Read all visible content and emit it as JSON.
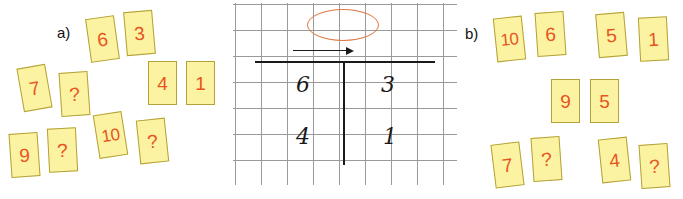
{
  "figure": {
    "panels": [
      {
        "label": "a)",
        "label_pos": {
          "x": 57,
          "y": 24
        },
        "cards": [
          {
            "value": "6",
            "x": 88,
            "y": 17,
            "rot": -8,
            "wide": false
          },
          {
            "value": "3",
            "x": 125,
            "y": 11,
            "rot": -5,
            "wide": false
          },
          {
            "value": "7",
            "x": 20,
            "y": 66,
            "rot": -10,
            "wide": false
          },
          {
            "value": "?",
            "x": 60,
            "y": 72,
            "rot": -4,
            "wide": false
          },
          {
            "value": "4",
            "x": 148,
            "y": 61,
            "rot": 0,
            "wide": false
          },
          {
            "value": "1",
            "x": 186,
            "y": 61,
            "rot": 0,
            "wide": false
          },
          {
            "value": "10",
            "x": 96,
            "y": 113,
            "rot": -9,
            "wide": true
          },
          {
            "value": "?",
            "x": 138,
            "y": 119,
            "rot": -6,
            "wide": false
          },
          {
            "value": "9",
            "x": 10,
            "y": 133,
            "rot": -4,
            "wide": false
          },
          {
            "value": "?",
            "x": 48,
            "y": 128,
            "rot": -3,
            "wide": false
          }
        ]
      },
      {
        "label": "b)",
        "label_pos": {
          "x": 465,
          "y": 25
        },
        "cards": [
          {
            "value": "10",
            "x": 495,
            "y": 17,
            "rot": -6,
            "wide": true
          },
          {
            "value": "6",
            "x": 536,
            "y": 12,
            "rot": -4,
            "wide": false
          },
          {
            "value": "5",
            "x": 597,
            "y": 13,
            "rot": -5,
            "wide": false
          },
          {
            "value": "1",
            "x": 639,
            "y": 17,
            "rot": -3,
            "wide": false
          },
          {
            "value": "9",
            "x": 551,
            "y": 79,
            "rot": 0,
            "wide": false
          },
          {
            "value": "5",
            "x": 590,
            "y": 79,
            "rot": 0,
            "wide": false
          },
          {
            "value": "7",
            "x": 493,
            "y": 143,
            "rot": -7,
            "wide": false
          },
          {
            "value": "?",
            "x": 532,
            "y": 137,
            "rot": -4,
            "wide": false
          },
          {
            "value": "4",
            "x": 600,
            "y": 138,
            "rot": -6,
            "wide": false
          },
          {
            "value": "?",
            "x": 640,
            "y": 144,
            "rot": -4,
            "wide": false
          }
        ]
      }
    ],
    "grid": {
      "cell_size": 26,
      "line_color": "#9a9a9a",
      "ellipse": {
        "x": 74,
        "y": 6,
        "width": 70,
        "height": 30,
        "color": "#e07a46"
      },
      "arrow": {
        "x": 60,
        "y": 47,
        "length": 55,
        "direction": "right",
        "color": "#1a1a1a"
      },
      "t_shape": {
        "horizontal": {
          "x": 22,
          "y": 58,
          "width": 180
        },
        "vertical": {
          "x": 110,
          "y": 58,
          "height": 104
        },
        "color": "#1a1a1a"
      },
      "digits": [
        {
          "value": "6",
          "x": 63,
          "y": 71
        },
        {
          "value": "3",
          "x": 148,
          "y": 71
        },
        {
          "value": "4",
          "x": 63,
          "y": 123
        },
        {
          "value": "1",
          "x": 150,
          "y": 123
        }
      ]
    },
    "colors": {
      "card_fill": "#fbf3a2",
      "card_border": "#b3a13a",
      "card_text": "#e8541f",
      "ellipse": "#e07a46",
      "ink": "#1a1a1a",
      "grid_line": "#9a9a9a",
      "background": "#ffffff"
    }
  }
}
